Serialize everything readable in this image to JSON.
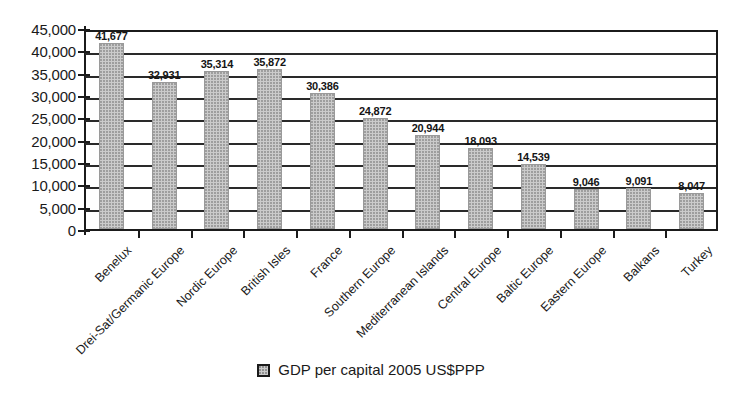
{
  "chart_data": {
    "type": "bar",
    "title": "",
    "xlabel": "",
    "ylabel": "",
    "ylim": [
      0,
      45000
    ],
    "ytick_step": 5000,
    "grid": true,
    "legend_position": "bottom-center",
    "bar_fill_color": "#cbcbcb",
    "axis_color": "#1b1b1b",
    "categories": [
      "Benelux",
      "Drei-Sat/Germanic Europe",
      "Nordic Europe",
      "British Isles",
      "France",
      "Southern Europe",
      "Mediterranean Islands",
      "Central Europe",
      "Baltic Europe",
      "Eastern Europe",
      "Balkans",
      "Turkey"
    ],
    "series": [
      {
        "name": "GDP per capital 2005 US$PPP",
        "values": [
          41677,
          32931,
          35314,
          35872,
          30386,
          24872,
          20944,
          18093,
          14539,
          9046,
          9091,
          8047
        ],
        "value_labels": [
          "41,677",
          "32,931",
          "35,314",
          "35,872",
          "30,386",
          "24,872",
          "20,944",
          "18,093",
          "14,539",
          "9,046",
          "9,091",
          "8,047"
        ]
      }
    ],
    "ytick_labels": [
      "45,000",
      "40,000",
      "35,000",
      "30,000",
      "25,000",
      "20,000",
      "15,000",
      "10,000",
      "5,000",
      "0"
    ],
    "ytick_values": [
      45000,
      40000,
      35000,
      30000,
      25000,
      20000,
      15000,
      10000,
      5000,
      0
    ]
  },
  "legend": {
    "entries": [
      {
        "label": "GDP per capital 2005 US$PPP",
        "swatch": "legend-swatch-gdp"
      }
    ]
  }
}
